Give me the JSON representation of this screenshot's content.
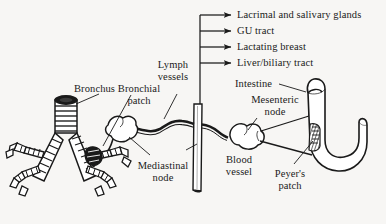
{
  "figure": {
    "type": "anatomical-diagram",
    "background_color": "#f7f6f4",
    "ink_color": "#1a1a1a"
  },
  "destinations": {
    "arrow_targets": [
      {
        "label": "Lacrimal and salivary glands",
        "icon": "arrow-right-icon"
      },
      {
        "label": "GU tract",
        "icon": "arrow-right-icon"
      },
      {
        "label": "Lactating breast",
        "icon": "arrow-right-icon"
      },
      {
        "label": "Liver/biliary tract",
        "icon": "arrow-right-icon"
      }
    ]
  },
  "callouts": {
    "bronchus": "Bronchus",
    "bronchial_patch_line1": "Bronchial",
    "bronchial_patch_line2": "patch",
    "lymph_vessels_line1": "Lymph",
    "lymph_vessels_line2": "vessels",
    "mediastinal_node_line1": "Mediastinal",
    "mediastinal_node_line2": "node",
    "blood_vessel_line1": "Blood",
    "blood_vessel_line2": "vessel",
    "intestine": "Intestine",
    "mesenteric_node_line1": "Mesenteric",
    "mesenteric_node_line2": "node",
    "peyers_patch_line1": "Peyer's",
    "peyers_patch_line2": "patch"
  }
}
